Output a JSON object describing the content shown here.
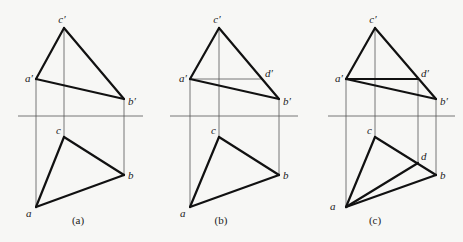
{
  "figure": {
    "panels": [
      {
        "id": "a",
        "caption": "(a)",
        "front_view": {
          "points": [
            {
              "name": "c'",
              "label": "c′"
            },
            {
              "name": "a'",
              "label": "a′"
            },
            {
              "name": "b'",
              "label": "b′"
            }
          ],
          "edges": [
            [
              "a'",
              "c'"
            ],
            [
              "c'",
              "b'"
            ],
            [
              "a'",
              "b'"
            ]
          ]
        },
        "top_view": {
          "points": [
            {
              "name": "c",
              "label": "c"
            },
            {
              "name": "b",
              "label": "b"
            },
            {
              "name": "a",
              "label": "a"
            }
          ],
          "edges": [
            [
              "a",
              "c"
            ],
            [
              "c",
              "b"
            ],
            [
              "a",
              "b"
            ]
          ]
        }
      },
      {
        "id": "b",
        "caption": "(b)",
        "front_view": {
          "points": [
            {
              "name": "c'",
              "label": "c′"
            },
            {
              "name": "a'",
              "label": "a′"
            },
            {
              "name": "d'",
              "label": "d′"
            },
            {
              "name": "b'",
              "label": "b′"
            }
          ],
          "edges": [
            [
              "a'",
              "c'"
            ],
            [
              "c'",
              "b'"
            ],
            [
              "a'",
              "b'"
            ]
          ],
          "construction": [
            [
              "a'",
              "d'"
            ]
          ]
        },
        "top_view": {
          "points": [
            {
              "name": "c",
              "label": "c"
            },
            {
              "name": "b",
              "label": "b"
            },
            {
              "name": "a",
              "label": "a"
            }
          ],
          "edges": [
            [
              "a",
              "c"
            ],
            [
              "c",
              "b"
            ],
            [
              "a",
              "b"
            ]
          ]
        }
      },
      {
        "id": "c",
        "caption": "(c)",
        "front_view": {
          "points": [
            {
              "name": "c'",
              "label": "c′"
            },
            {
              "name": "a'",
              "label": "a′"
            },
            {
              "name": "d'",
              "label": "d′"
            },
            {
              "name": "b'",
              "label": "b′"
            }
          ],
          "edges": [
            [
              "a'",
              "c'"
            ],
            [
              "c'",
              "b'"
            ],
            [
              "a'",
              "b'"
            ],
            [
              "a'",
              "d'"
            ]
          ]
        },
        "top_view": {
          "points": [
            {
              "name": "c",
              "label": "c"
            },
            {
              "name": "d",
              "label": "d"
            },
            {
              "name": "b",
              "label": "b"
            },
            {
              "name": "a",
              "label": "a"
            }
          ],
          "edges": [
            [
              "a",
              "c"
            ],
            [
              "c",
              "b"
            ],
            [
              "a",
              "b"
            ],
            [
              "a",
              "d"
            ]
          ]
        }
      }
    ]
  }
}
